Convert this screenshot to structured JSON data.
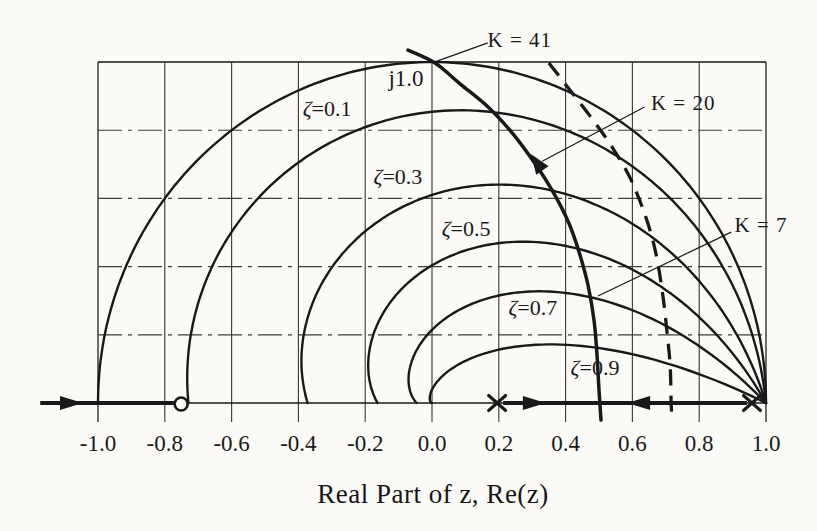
{
  "chart_data": {
    "type": "line",
    "xlabel": "Real Part of z, Re(z)",
    "x_range": [
      -1.0,
      1.0
    ],
    "y_range_im": [
      0,
      1.0
    ],
    "x_ticks": [
      -1.0,
      -0.8,
      -0.6,
      -0.4,
      -0.2,
      0.0,
      0.2,
      0.4,
      0.6,
      0.8,
      1.0
    ],
    "x_tick_labels": [
      "-1.0",
      "-0.8",
      "-0.6",
      "-0.4",
      "-0.2",
      "0.0",
      "0.2",
      "0.4",
      "0.6",
      "0.8",
      "1.0"
    ],
    "imag_axis_marker": {
      "text": "j1.0",
      "re": -0.078,
      "im": 0.945
    },
    "grid": {
      "x_step": 0.2,
      "im_step": 0.2,
      "h_style": "dash-dot",
      "v_style": "solid"
    },
    "damping_loci": {
      "zeta_values": [
        0,
        0.1,
        0.3,
        0.5,
        0.7,
        0.9
      ],
      "labels": [
        {
          "text": "ζ=0.1",
          "re": -0.314,
          "im": 0.856
        },
        {
          "text": "ζ=0.3",
          "re": -0.102,
          "im": 0.657
        },
        {
          "text": "ζ=0.5",
          "re": 0.102,
          "im": 0.504
        },
        {
          "text": "ζ=0.7",
          "re": 0.302,
          "im": 0.273
        },
        {
          "text": "ζ=0.9",
          "re": 0.488,
          "im": 0.097
        }
      ]
    },
    "root_locus": {
      "zero_re": -0.751,
      "poles_re": [
        0.195,
        0.958
      ],
      "breakaway_re": 0.5,
      "real_axis_segments": [
        [
          -1.173,
          -0.771
        ],
        [
          0.213,
          0.943
        ]
      ],
      "real_axis_arrows": [
        {
          "re": -1.045,
          "dir": "right"
        },
        {
          "re": 0.341,
          "dir": "right"
        },
        {
          "re": 0.584,
          "dir": "left"
        }
      ],
      "complex_branch": [
        [
          0.506,
          -0.05
        ],
        [
          0.5,
          0.038
        ],
        [
          0.494,
          0.141
        ],
        [
          0.485,
          0.243
        ],
        [
          0.467,
          0.346
        ],
        [
          0.443,
          0.434
        ],
        [
          0.41,
          0.527
        ],
        [
          0.359,
          0.625
        ],
        [
          0.305,
          0.707
        ],
        [
          0.24,
          0.792
        ],
        [
          0.168,
          0.868
        ],
        [
          0.084,
          0.936
        ],
        [
          0.009,
          0.997
        ],
        [
          -0.072,
          1.035
        ]
      ],
      "branch_arrow": {
        "re": 0.296,
        "im": 0.73,
        "angle_deg": 235
      }
    },
    "dashed_branch": [
      [
        0.35,
        0.997
      ],
      [
        0.413,
        0.918
      ],
      [
        0.482,
        0.83
      ],
      [
        0.539,
        0.751
      ],
      [
        0.593,
        0.66
      ],
      [
        0.638,
        0.551
      ],
      [
        0.668,
        0.449
      ],
      [
        0.689,
        0.331
      ],
      [
        0.703,
        0.214
      ],
      [
        0.713,
        0.111
      ],
      [
        0.716,
        0.0
      ],
      [
        0.719,
        -0.05
      ]
    ],
    "gain_labels": [
      {
        "text": "K = 41",
        "re": 0.263,
        "im": 1.058,
        "leader": [
          [
            0.167,
            1.056
          ],
          [
            0.013,
            1.002
          ]
        ]
      },
      {
        "text": "K = 20",
        "re": 0.752,
        "im": 0.874,
        "leader": [
          [
            0.636,
            0.868
          ],
          [
            0.33,
            0.709
          ]
        ]
      },
      {
        "text": "K = 7",
        "re": 0.985,
        "im": 0.516,
        "leader": [
          [
            0.896,
            0.501
          ],
          [
            0.497,
            0.314
          ]
        ]
      }
    ],
    "colors": {
      "ink": "#191919",
      "grid_line": "#3d3d3d",
      "paper": "#fbfaf7"
    }
  }
}
